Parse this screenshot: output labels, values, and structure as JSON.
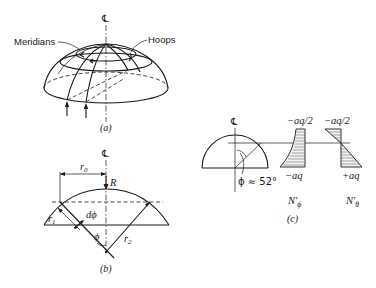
{
  "figure": {
    "panel_a": {
      "centerline_symbol": "℄",
      "meridians_label": "Meridians",
      "hoops_label": "Hoops",
      "caption": "(a)"
    },
    "panel_b": {
      "centerline_symbol": "℄",
      "r0_label": "r",
      "r0_sub": "0",
      "R_label": "R",
      "r1_label": "r",
      "r1_sub": "1",
      "r2_label": "r",
      "r2_sub": "2",
      "dphi_label": "dϕ",
      "phi_label": "ϕ",
      "caption": "(b)"
    },
    "panel_c": {
      "centerline_symbol": "℄",
      "angle_label": "ϕ ≈ 52°",
      "nphi_top": "−aq/2",
      "nphi_bottom": "−aq",
      "ntheta_top": "−aq/2",
      "ntheta_bottom": "+aq",
      "nphi_name": "N′",
      "nphi_sub": "ϕ",
      "ntheta_name": "N′",
      "ntheta_sub": "θ",
      "caption": "(c)"
    }
  }
}
